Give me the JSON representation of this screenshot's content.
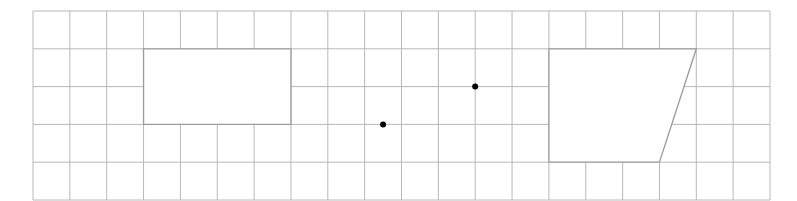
{
  "diagram": {
    "type": "grid-geometry",
    "grid": {
      "columns": 20,
      "rows": 5,
      "origin_px": [
        33,
        11
      ],
      "cell_width_px": 36.85,
      "cell_height_px": 37.8,
      "line_color": "#b8b8b8"
    },
    "shapes": [
      {
        "name": "rectangle",
        "points": [
          [
            3,
            1
          ],
          [
            7,
            1
          ],
          [
            7,
            3
          ],
          [
            3,
            3
          ]
        ],
        "fill": "#ffffff",
        "stroke": "#9a9a9a"
      },
      {
        "name": "trapezoid",
        "points": [
          [
            14,
            1
          ],
          [
            18,
            1
          ],
          [
            17,
            4
          ],
          [
            14,
            4
          ]
        ],
        "fill": "#ffffff",
        "stroke": "#9a9a9a"
      }
    ],
    "points": [
      {
        "name": "point-a",
        "at": [
          9.5,
          3
        ],
        "color": "#000000"
      },
      {
        "name": "point-b",
        "at": [
          12,
          2
        ],
        "color": "#000000"
      }
    ]
  }
}
